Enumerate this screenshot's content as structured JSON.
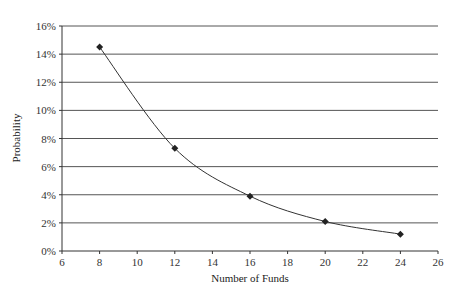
{
  "chart_data": {
    "type": "line",
    "title": "",
    "xlabel": "Number of Funds",
    "ylabel": "Probability",
    "xlim": [
      6,
      26
    ],
    "ylim": [
      0,
      0.16
    ],
    "x_ticks": [
      6,
      8,
      10,
      12,
      14,
      16,
      18,
      20,
      22,
      24,
      26
    ],
    "y_ticks": [
      "0%",
      "2%",
      "4%",
      "6%",
      "8%",
      "10%",
      "12%",
      "14%",
      "16%"
    ],
    "grid": {
      "horizontal": true,
      "vertical": false
    },
    "legend": null,
    "series": [
      {
        "name": "Probability",
        "marker": "diamond",
        "smooth": true,
        "x": [
          8,
          12,
          16,
          20,
          24
        ],
        "values": [
          0.145,
          0.073,
          0.039,
          0.021,
          0.012
        ]
      }
    ]
  },
  "colors": {
    "line": "#333333",
    "grid": "#555555",
    "marker": "#222222"
  }
}
